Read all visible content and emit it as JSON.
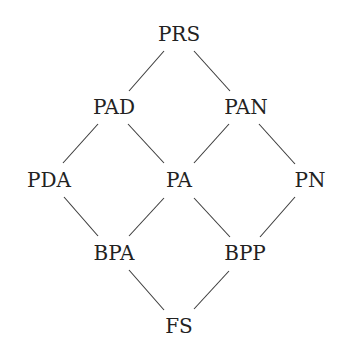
{
  "diagram": {
    "type": "lattice",
    "nodes": [
      {
        "id": "PRS",
        "label": "PRS",
        "x": 179,
        "y": 34
      },
      {
        "id": "PAD",
        "label": "PAD",
        "x": 114,
        "y": 107
      },
      {
        "id": "PAN",
        "label": "PAN",
        "x": 246,
        "y": 107
      },
      {
        "id": "PDA",
        "label": "PDA",
        "x": 49,
        "y": 180
      },
      {
        "id": "PA",
        "label": "PA",
        "x": 179,
        "y": 180
      },
      {
        "id": "PN",
        "label": "PN",
        "x": 310,
        "y": 180
      },
      {
        "id": "BPA",
        "label": "BPA",
        "x": 114,
        "y": 253
      },
      {
        "id": "BPP",
        "label": "BPP",
        "x": 245,
        "y": 253
      },
      {
        "id": "FS",
        "label": "FS",
        "x": 179,
        "y": 326
      }
    ],
    "edges": [
      {
        "from": "PRS",
        "to": "PAD",
        "x1": 164,
        "y1": 51,
        "x2": 129,
        "y2": 91
      },
      {
        "from": "PRS",
        "to": "PAN",
        "x1": 194,
        "y1": 51,
        "x2": 230,
        "y2": 91
      },
      {
        "from": "PAD",
        "to": "PDA",
        "x1": 98,
        "y1": 124,
        "x2": 63,
        "y2": 163
      },
      {
        "from": "PAD",
        "to": "PA",
        "x1": 128,
        "y1": 124,
        "x2": 164,
        "y2": 163
      },
      {
        "from": "PAN",
        "to": "PA",
        "x1": 229,
        "y1": 124,
        "x2": 194,
        "y2": 163
      },
      {
        "from": "PAN",
        "to": "PN",
        "x1": 259,
        "y1": 124,
        "x2": 295,
        "y2": 164
      },
      {
        "from": "PDA",
        "to": "BPA",
        "x1": 64,
        "y1": 197,
        "x2": 98,
        "y2": 236
      },
      {
        "from": "PA",
        "to": "BPA",
        "x1": 164,
        "y1": 198,
        "x2": 129,
        "y2": 236
      },
      {
        "from": "PA",
        "to": "BPP",
        "x1": 194,
        "y1": 198,
        "x2": 230,
        "y2": 237
      },
      {
        "from": "PN",
        "to": "BPP",
        "x1": 295,
        "y1": 197,
        "x2": 260,
        "y2": 237
      },
      {
        "from": "BPA",
        "to": "FS",
        "x1": 129,
        "y1": 270,
        "x2": 164,
        "y2": 310
      },
      {
        "from": "BPP",
        "to": "FS",
        "x1": 229,
        "y1": 271,
        "x2": 194,
        "y2": 309
      }
    ],
    "colors": {
      "text": "#222222",
      "edge": "#3a3a3a",
      "background": "#ffffff"
    }
  }
}
